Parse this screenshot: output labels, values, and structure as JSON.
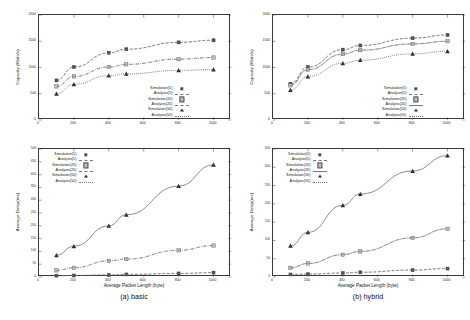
{
  "figure": {
    "panels": [
      {
        "id": "a-top",
        "caption": "",
        "chart_index": 0
      },
      {
        "id": "a-bottom",
        "caption": "(a) basic",
        "chart_index": 1
      },
      {
        "id": "b-top",
        "caption": "",
        "chart_index": 2
      },
      {
        "id": "b-bottom",
        "caption": "(b) hybrid",
        "chart_index": 3
      }
    ],
    "captions": {
      "left": "(a) basic",
      "right": "(b) hybrid"
    }
  },
  "chart_data": [
    {
      "type": "line",
      "title": "",
      "panel": "top-left",
      "xlabel": "",
      "ylabel": "Capacity (Kbits/s)",
      "xlim": [
        0,
        1100
      ],
      "ylim": [
        0,
        2000
      ],
      "xticks": [
        0,
        200,
        400,
        600,
        800,
        1000
      ],
      "xticklabels": [
        "0",
        "200",
        "400",
        "600",
        "800",
        "1000"
      ],
      "yticks": [
        0,
        500,
        1000,
        1500,
        2000
      ],
      "yticklabels": [
        "0",
        "500",
        "1000",
        "1500",
        "2000"
      ],
      "grid": false,
      "legend_position": "lower right",
      "x": [
        100,
        200,
        400,
        500,
        800,
        1000
      ],
      "series": [
        {
          "name": "Simulation(5)",
          "marker": "filled-square",
          "line": "dashed",
          "values": [
            755,
            1010,
            1280,
            1350,
            1480,
            1520
          ]
        },
        {
          "name": "Analysis(5)",
          "marker": "none",
          "line": "dashed",
          "values": [
            750,
            1005,
            1275,
            1345,
            1478,
            1518
          ]
        },
        {
          "name": "Simulation(20)",
          "marker": "open-square",
          "line": "dashdot",
          "values": [
            640,
            830,
            1010,
            1060,
            1160,
            1190
          ]
        },
        {
          "name": "Analysis(20)",
          "marker": "none",
          "line": "dashdot",
          "values": [
            638,
            828,
            1008,
            1058,
            1158,
            1188
          ]
        },
        {
          "name": "Simulation(50)",
          "marker": "filled-triangle",
          "line": "dotted",
          "values": [
            500,
            680,
            845,
            880,
            945,
            960
          ]
        },
        {
          "name": "Analysis(50)",
          "marker": "none",
          "line": "dotted",
          "values": [
            498,
            678,
            843,
            878,
            943,
            958
          ]
        }
      ]
    },
    {
      "type": "line",
      "title": "",
      "panel": "bottom-left",
      "xlabel": "Average Packet Length (byte)",
      "ylabel": "Average Delay(ms)",
      "xlim": [
        0,
        1100
      ],
      "ylim": [
        0,
        500
      ],
      "xticks": [
        0,
        200,
        400,
        600,
        800,
        1000
      ],
      "xticklabels": [
        "0",
        "200",
        "400",
        "600",
        "800",
        "1000"
      ],
      "yticks": [
        0,
        50,
        100,
        150,
        200,
        250,
        300,
        350,
        400,
        450,
        500
      ],
      "yticklabels": [
        "0",
        "50",
        "100",
        "150",
        "200",
        "250",
        "300",
        "350",
        "400",
        "450",
        "500"
      ],
      "grid": false,
      "legend_position": "upper left",
      "x": [
        100,
        200,
        400,
        500,
        800,
        1000
      ],
      "series": [
        {
          "name": "Simulation(5)",
          "marker": "filled-square",
          "line": "dashed",
          "values": [
            5,
            6,
            8,
            10,
            14,
            17
          ]
        },
        {
          "name": "Analysis(5)",
          "marker": "none",
          "line": "dashed",
          "values": [
            5,
            6,
            8,
            10,
            14,
            17
          ]
        },
        {
          "name": "Simulation(20)",
          "marker": "open-square",
          "line": "dashdot",
          "values": [
            26,
            36,
            63,
            70,
            104,
            123
          ]
        },
        {
          "name": "Analysis(20)",
          "marker": "none",
          "line": "dashdot",
          "values": [
            26,
            36,
            63,
            70,
            104,
            123
          ]
        },
        {
          "name": "Simulation(50)",
          "marker": "filled-triangle",
          "line": "solid",
          "values": [
            85,
            120,
            200,
            243,
            355,
            438
          ]
        },
        {
          "name": "Analysis(50)",
          "marker": "none",
          "line": "dotted",
          "values": [
            85,
            120,
            200,
            243,
            355,
            438
          ]
        }
      ]
    },
    {
      "type": "line",
      "title": "",
      "panel": "top-right",
      "xlabel": "",
      "ylabel": "Capacity (Kbits/s)",
      "xlim": [
        0,
        1100
      ],
      "ylim": [
        0,
        2000
      ],
      "xticks": [
        0,
        200,
        400,
        600,
        800,
        1000
      ],
      "xticklabels": [
        "0",
        "200",
        "400",
        "600",
        "800",
        "1000"
      ],
      "yticks": [
        0,
        500,
        1000,
        1500,
        2000
      ],
      "yticklabels": [
        "0",
        "500",
        "1000",
        "1500",
        "2000"
      ],
      "grid": false,
      "legend_position": "lower right",
      "x": [
        100,
        200,
        400,
        500,
        800,
        1000
      ],
      "series": [
        {
          "name": "Simulation(5)",
          "marker": "filled-square",
          "line": "dashed",
          "values": [
            690,
            1010,
            1340,
            1420,
            1560,
            1620
          ]
        },
        {
          "name": "Analysis(5)",
          "marker": "none",
          "line": "dashed",
          "values": [
            688,
            1008,
            1338,
            1418,
            1558,
            1618
          ]
        },
        {
          "name": "Simulation(20)",
          "marker": "open-square",
          "line": "dashdot",
          "values": [
            660,
            960,
            1255,
            1330,
            1450,
            1500
          ]
        },
        {
          "name": "Analysis(20)",
          "marker": "none",
          "line": "solid",
          "values": [
            658,
            958,
            1253,
            1328,
            1448,
            1498
          ]
        },
        {
          "name": "Simulation(50)",
          "marker": "filled-triangle",
          "line": "dotted",
          "values": [
            570,
            830,
            1080,
            1140,
            1260,
            1310
          ]
        },
        {
          "name": "Analysis(50)",
          "marker": "none",
          "line": "dotted",
          "values": [
            568,
            828,
            1078,
            1138,
            1258,
            1308
          ]
        }
      ]
    },
    {
      "type": "line",
      "title": "",
      "panel": "bottom-right",
      "xlabel": "Average Packet Length (byte)",
      "ylabel": "Average Delay(ms)",
      "xlim": [
        0,
        1100
      ],
      "ylim": [
        0,
        350
      ],
      "xticks": [
        0,
        200,
        400,
        600,
        800,
        1000
      ],
      "xticklabels": [
        "0",
        "200",
        "400",
        "600",
        "800",
        "1000"
      ],
      "yticks": [
        0,
        50,
        100,
        150,
        200,
        250,
        300,
        350
      ],
      "yticklabels": [
        "0",
        "50",
        "100",
        "150",
        "200",
        "250",
        "300",
        "350"
      ],
      "grid": false,
      "legend_position": "upper left",
      "x": [
        100,
        200,
        400,
        500,
        800,
        1000
      ],
      "series": [
        {
          "name": "Simulation(5)",
          "marker": "filled-square",
          "line": "dashed",
          "values": [
            7,
            8,
            11,
            13,
            19,
            23
          ]
        },
        {
          "name": "Analysis(5)",
          "marker": "none",
          "line": "dashed",
          "values": [
            7,
            8,
            11,
            13,
            19,
            23
          ]
        },
        {
          "name": "Simulation(20)",
          "marker": "open-square",
          "line": "dashdot",
          "values": [
            25,
            37,
            61,
            70,
            107,
            132
          ]
        },
        {
          "name": "Analysis(20)",
          "marker": "none",
          "line": "solid",
          "values": [
            25,
            37,
            61,
            70,
            107,
            132
          ]
        },
        {
          "name": "Simulation(50)",
          "marker": "filled-triangle",
          "line": "solid",
          "values": [
            85,
            122,
            196,
            227,
            290,
            332
          ]
        },
        {
          "name": "Analysis(50)",
          "marker": "none",
          "line": "dotted",
          "values": [
            85,
            122,
            196,
            227,
            290,
            332
          ]
        }
      ]
    }
  ],
  "legend_entries": [
    "Simulation(5)",
    "Analysis(5)",
    "Simulation(20)",
    "Analysis(20)",
    "Simulation(50)",
    "Analysis(50)"
  ],
  "colors": {
    "axis": "#3a3a3a",
    "text": "#1a1a1a",
    "series_dark": "#555555",
    "background": "#ffffff"
  }
}
